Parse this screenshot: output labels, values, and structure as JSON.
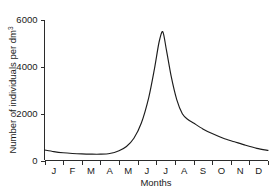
{
  "chart_data": {
    "type": "line",
    "title": "",
    "xlabel": "Months",
    "ylabel": "Number of individuals per dm",
    "ylabel_superscript": "3",
    "categories": [
      "J",
      "F",
      "M",
      "A",
      "M",
      "J",
      "J",
      "A",
      "S",
      "O",
      "N",
      "D"
    ],
    "x_tick_labels": [
      "J",
      "F",
      "M",
      "A",
      "M",
      "J",
      "J",
      "A",
      "S",
      "O",
      "N",
      "D"
    ],
    "y_tick_labels": [
      "0",
      "2000",
      "4000",
      "6000"
    ],
    "y_tick_values": [
      0,
      2000,
      4000,
      6000
    ],
    "ylim": [
      0,
      6000
    ],
    "xlim": [
      0,
      12
    ],
    "grid": false,
    "legend": false,
    "series": [
      {
        "name": "Population density",
        "values": [
          450,
          330,
          280,
          270,
          420,
          1500,
          5500,
          1750,
          1150,
          800,
          600,
          430
        ],
        "points": [
          {
            "x": 0.0,
            "y": 450
          },
          {
            "x": 0.5,
            "y": 380
          },
          {
            "x": 1.0,
            "y": 330
          },
          {
            "x": 1.5,
            "y": 300
          },
          {
            "x": 2.0,
            "y": 280
          },
          {
            "x": 2.5,
            "y": 270
          },
          {
            "x": 3.0,
            "y": 270
          },
          {
            "x": 3.5,
            "y": 300
          },
          {
            "x": 4.0,
            "y": 420
          },
          {
            "x": 4.4,
            "y": 600
          },
          {
            "x": 4.8,
            "y": 950
          },
          {
            "x": 5.2,
            "y": 1600
          },
          {
            "x": 5.6,
            "y": 2700
          },
          {
            "x": 5.9,
            "y": 3900
          },
          {
            "x": 6.15,
            "y": 5050
          },
          {
            "x": 6.35,
            "y": 5500
          },
          {
            "x": 6.55,
            "y": 4700
          },
          {
            "x": 6.8,
            "y": 3600
          },
          {
            "x": 7.1,
            "y": 2600
          },
          {
            "x": 7.4,
            "y": 2000
          },
          {
            "x": 7.7,
            "y": 1750
          },
          {
            "x": 8.0,
            "y": 1600
          },
          {
            "x": 8.5,
            "y": 1350
          },
          {
            "x": 9.0,
            "y": 1150
          },
          {
            "x": 9.6,
            "y": 950
          },
          {
            "x": 10.2,
            "y": 800
          },
          {
            "x": 10.8,
            "y": 650
          },
          {
            "x": 11.4,
            "y": 520
          },
          {
            "x": 12.0,
            "y": 430
          }
        ]
      }
    ],
    "peak": {
      "month": "J",
      "approx_value": 5500
    },
    "colors": {
      "line": "#1c1c1c",
      "axis": "#2b2b2b",
      "background": "#ffffff"
    }
  }
}
